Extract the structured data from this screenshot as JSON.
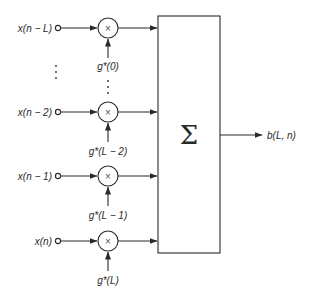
{
  "diagram": {
    "type": "block-diagram",
    "title": "",
    "inputs": [
      {
        "label": "x(n − L)",
        "coeff": "g*(0)",
        "y": 28
      },
      {
        "label": "x(n − 2)",
        "coeff": "g*(L − 2)",
        "y": 112
      },
      {
        "label": "x(n − 1)",
        "coeff": "g*(L − 1)",
        "y": 176
      },
      {
        "label": "x(n)",
        "coeff": "g*(L)",
        "y": 241
      }
    ],
    "multiplier_symbol": "×",
    "summer": {
      "symbol": "Σ"
    },
    "output": {
      "label": "b(L, n)"
    },
    "ellipsis": "⋮",
    "colors": {
      "line": "#2a2a2a",
      "background": "#ffffff"
    }
  }
}
